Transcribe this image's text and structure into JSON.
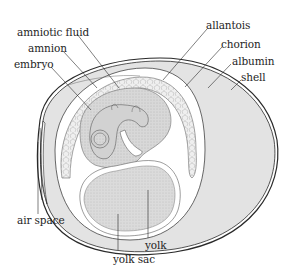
{
  "diagram": {
    "labels": {
      "amniotic_fluid": "amniotic fluid",
      "amnion": "amnion",
      "embryo": "embryo",
      "allantois": "allantois",
      "chorion": "chorion",
      "albumin": "albumin",
      "shell": "shell",
      "air_space": "air space",
      "yolk": "yolk",
      "yolk_sac": "yolk sac"
    },
    "colors": {
      "background": "#ffffff",
      "outline": "#2a2a2a",
      "albumin_fill": "#e3e3e3",
      "yolk_fill": "#dcdcdc",
      "embryo_fill": "#d2d2d2",
      "allantois_fill": "#eeeeee",
      "label_text": "#1e1e1e"
    }
  }
}
